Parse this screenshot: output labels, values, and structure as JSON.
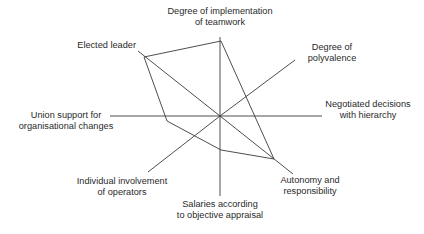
{
  "chart_data": {
    "type": "radar",
    "title": "",
    "center": [
      220,
      116
    ],
    "axes": [
      {
        "id": "teamwork",
        "label_lines": [
          "Degree of implementation",
          "of teamwork"
        ],
        "end": [
          220,
          37
        ]
      },
      {
        "id": "polyvalence",
        "label_lines": [
          "Degree of",
          "polyvalence"
        ],
        "end": [
          295,
          60
        ]
      },
      {
        "id": "negotiated",
        "label_lines": [
          "Negotiated decisions",
          "with hierarchy"
        ],
        "end": [
          322,
          116
        ]
      },
      {
        "id": "autonomy",
        "label_lines": [
          "Autonomy and",
          "responsibility"
        ],
        "end": [
          293,
          174
        ]
      },
      {
        "id": "salaries",
        "label_lines": [
          "Salaries according",
          "to objective appraisal"
        ],
        "end": [
          220,
          196
        ]
      },
      {
        "id": "involvement",
        "label_lines": [
          "Individual involvement",
          "of operators"
        ],
        "end": [
          148,
          172
        ]
      },
      {
        "id": "union",
        "label_lines": [
          "Union support for",
          "organisational changes"
        ],
        "end": [
          110,
          116
        ]
      },
      {
        "id": "leader",
        "label_lines": [
          "Elected leader"
        ],
        "end": [
          138,
          51
        ]
      }
    ],
    "series": [
      {
        "name": "profile",
        "points": [
          [
            144,
            57
          ],
          [
            221,
            41
          ],
          [
            274,
            159
          ],
          [
            221,
            150
          ],
          [
            167,
            121
          ]
        ],
        "relative_values": {
          "teamwork": 0.95,
          "polyvalence": 0.0,
          "negotiated": 0.0,
          "autonomy": 0.75,
          "salaries": 0.43,
          "involvement": 0.0,
          "union": 0.5,
          "leader": 0.92
        }
      }
    ],
    "grid": false,
    "legend": "none"
  },
  "labels": {
    "teamwork": [
      "Degree of implementation",
      "of teamwork"
    ],
    "polyvalence": [
      "Degree of",
      "polyvalence"
    ],
    "negotiated": [
      "Negotiated decisions",
      "with hierarchy"
    ],
    "autonomy": [
      "Autonomy and",
      "responsibility"
    ],
    "salaries": [
      "Salaries according",
      "to objective appraisal"
    ],
    "involvement": [
      "Individual involvement",
      "of operators"
    ],
    "union": [
      "Union support for",
      "organisational changes"
    ],
    "leader": [
      "Elected leader"
    ]
  },
  "colors": {
    "line": "#3a3a3a",
    "text": "#2a2a2a",
    "background": "#ffffff"
  }
}
